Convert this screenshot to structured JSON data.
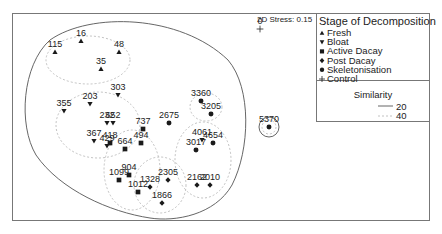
{
  "chart_data": {
    "type": "scatter",
    "title": "",
    "subtitle": "2D Stress: 0.15",
    "xlabel": "",
    "ylabel": "",
    "grid": false,
    "legend_position": "top-right",
    "legend": {
      "title": "Stage of Decomposition",
      "entries": [
        {
          "name": "Fresh",
          "marker": "triangle-up"
        },
        {
          "name": "Bloat",
          "marker": "triangle-down"
        },
        {
          "name": "Active Dacay",
          "marker": "square"
        },
        {
          "name": "Post Dacay",
          "marker": "diamond"
        },
        {
          "name": "Skeletonisation",
          "marker": "circle"
        },
        {
          "name": "Control",
          "marker": "plus"
        }
      ],
      "similarity_title": "Similarity",
      "similarity": [
        {
          "value": "20",
          "style": "solid"
        },
        {
          "value": "40",
          "style": "dashed"
        }
      ]
    },
    "series": [
      {
        "name": "Fresh",
        "points": [
          {
            "label": "115",
            "x": 55,
            "y": 52
          },
          {
            "label": "16",
            "x": 81,
            "y": 41
          },
          {
            "label": "48",
            "x": 119,
            "y": 52
          },
          {
            "label": "35",
            "x": 101,
            "y": 69
          }
        ]
      },
      {
        "name": "Bloat",
        "points": [
          {
            "label": "303",
            "x": 118,
            "y": 95
          },
          {
            "label": "203",
            "x": 90,
            "y": 104
          },
          {
            "label": "355",
            "x": 64,
            "y": 111
          },
          {
            "label": "232",
            "x": 107,
            "y": 123
          },
          {
            "label": "652",
            "x": 113,
            "y": 123
          },
          {
            "label": "367",
            "x": 94,
            "y": 141
          },
          {
            "label": "429",
            "x": 107,
            "y": 146
          },
          {
            "label": "4061",
            "x": 202,
            "y": 140
          }
        ]
      },
      {
        "name": "Active Dacay",
        "points": [
          {
            "label": "418",
            "x": 110,
            "y": 143
          },
          {
            "label": "737",
            "x": 143,
            "y": 129
          },
          {
            "label": "494",
            "x": 141,
            "y": 143
          },
          {
            "label": "664",
            "x": 125,
            "y": 149
          },
          {
            "label": "904",
            "x": 129,
            "y": 175
          },
          {
            "label": "1099",
            "x": 119,
            "y": 180
          },
          {
            "label": "1012",
            "x": 138,
            "y": 192
          }
        ]
      },
      {
        "name": "Post Dacay",
        "points": [
          {
            "label": "1328",
            "x": 150,
            "y": 187
          },
          {
            "label": "2305",
            "x": 168,
            "y": 180
          },
          {
            "label": "1866",
            "x": 162,
            "y": 203
          },
          {
            "label": "2162",
            "x": 197,
            "y": 185
          },
          {
            "label": "2010",
            "x": 210,
            "y": 185
          }
        ]
      },
      {
        "name": "Skeletonisation",
        "points": [
          {
            "label": "2675",
            "x": 169,
            "y": 123
          },
          {
            "label": "3360",
            "x": 201,
            "y": 101
          },
          {
            "label": "3205",
            "x": 211,
            "y": 114
          },
          {
            "label": "4654",
            "x": 213,
            "y": 143
          },
          {
            "label": "3017",
            "x": 196,
            "y": 150
          },
          {
            "label": "5370",
            "x": 269,
            "y": 127
          }
        ]
      },
      {
        "name": "Control",
        "points": [
          {
            "label": "0",
            "x": 260,
            "y": 29
          }
        ]
      }
    ]
  }
}
